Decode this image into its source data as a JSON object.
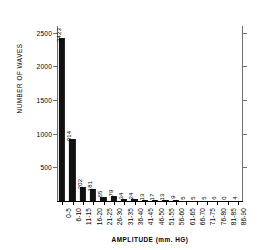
{
  "chart_data": {
    "type": "bar",
    "title": "",
    "xlabel": "AMPLITUDE (mm. HG)",
    "ylabel": "NUMBER OF WAVES",
    "ylim": [
      0,
      2600
    ],
    "yticks": [
      500,
      1000,
      1500,
      2000,
      2500
    ],
    "ytick_labels": [
      "500",
      "1000",
      "1500",
      "2000",
      "2500"
    ],
    "grid": false,
    "legend": null,
    "categories": [
      "0-5",
      "6-10",
      "11-15",
      "16-20",
      "21-25",
      "26-30",
      "31-35",
      "36-40",
      "41-45",
      "46-50",
      "51-55",
      "56-60",
      "61-65",
      "66-70",
      "71-75",
      "76-80",
      "81-85",
      "86-90"
    ],
    "values": [
      2423,
      914,
      202,
      181,
      65,
      79,
      34,
      24,
      13,
      17,
      13,
      9,
      5,
      5,
      5,
      6,
      0,
      4
    ],
    "value_labels": [
      "2423",
      "914",
      "202",
      "181",
      "65",
      "79",
      "34",
      "24",
      "13",
      "17",
      "13",
      "9",
      "5",
      "5",
      "5",
      "6",
      "0",
      "4"
    ],
    "bar_color": "#111111",
    "axis_color": "#6f6f6f"
  }
}
